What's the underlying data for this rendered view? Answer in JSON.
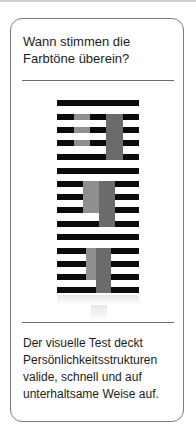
{
  "card": {
    "title_line1": "Wann stimmen die",
    "title_line2": "Farbtöne überein?",
    "description_lines": [
      "Der visuelle Test deckt",
      "Persönlichkeitsstrukturen",
      "valide, schnell und auf",
      "unterhaltsame Weise auf."
    ]
  },
  "illusion": {
    "bar_color": "#0b0b0b",
    "light_gray": "#8c8c8c",
    "dark_gray": "#6a6a6a",
    "groups": 3,
    "bars_per_group": 5
  }
}
